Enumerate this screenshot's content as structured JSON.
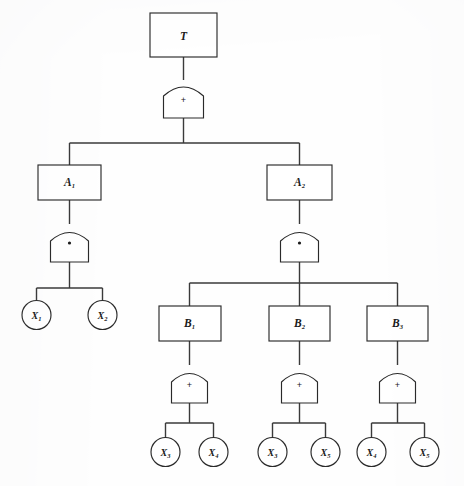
{
  "diagram": {
    "type": "fault-tree",
    "background_color": "#fefefe",
    "line_color": "#3a3a3a",
    "text_color": "#1a1a1a",
    "gate_symbols": {
      "or": "+",
      "and": "·"
    },
    "nodes": {
      "top_event": {
        "base": "T",
        "sub": ""
      },
      "intermediate_a1": {
        "base": "A",
        "sub": "1"
      },
      "intermediate_a2": {
        "base": "A",
        "sub": "2"
      },
      "intermediate_b1": {
        "base": "B",
        "sub": "1"
      },
      "intermediate_b2": {
        "base": "B",
        "sub": "2"
      },
      "intermediate_b3": {
        "base": "B",
        "sub": "3"
      },
      "basic_x1": {
        "base": "X",
        "sub": "1"
      },
      "basic_x2": {
        "base": "X",
        "sub": "2"
      },
      "basic_x3a": {
        "base": "X",
        "sub": "3"
      },
      "basic_x4a": {
        "base": "X",
        "sub": "4"
      },
      "basic_x3b": {
        "base": "X",
        "sub": "3"
      },
      "basic_x5b": {
        "base": "X",
        "sub": "5"
      },
      "basic_x4c": {
        "base": "X",
        "sub": "4"
      },
      "basic_x5c": {
        "base": "X",
        "sub": "5"
      }
    },
    "gates": {
      "gate_top": {
        "operator": "+",
        "kind": "or"
      },
      "gate_a1": {
        "operator": "·",
        "kind": "and"
      },
      "gate_a2": {
        "operator": "·",
        "kind": "and"
      },
      "gate_b1": {
        "operator": "+",
        "kind": "or"
      },
      "gate_b2": {
        "operator": "+",
        "kind": "or"
      },
      "gate_b3": {
        "operator": "+",
        "kind": "or"
      }
    },
    "structure": {
      "top_event_children": [
        "A1",
        "A2"
      ],
      "a1_children": [
        "X1",
        "X2"
      ],
      "a2_children": [
        "B1",
        "B2",
        "B3"
      ],
      "b1_children": [
        "X3",
        "X4"
      ],
      "b2_children": [
        "X3",
        "X5"
      ],
      "b3_children": [
        "X4",
        "X5"
      ]
    }
  }
}
